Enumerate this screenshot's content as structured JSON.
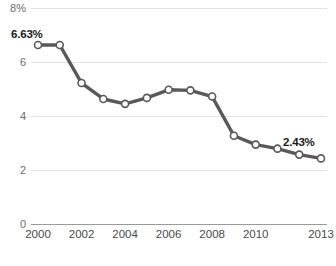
{
  "chart_data": {
    "type": "line",
    "title": "",
    "xlabel": "",
    "ylabel": "",
    "ylim": [
      0,
      8
    ],
    "grid": true,
    "legend": false,
    "x": [
      2000,
      2001,
      2002,
      2003,
      2004,
      2005,
      2006,
      2007,
      2008,
      2009,
      2010,
      2011,
      2012,
      2013
    ],
    "categories": [
      "2000",
      "2001",
      "2002",
      "2003",
      "2004",
      "2005",
      "2006",
      "2007",
      "2008",
      "2009",
      "2010",
      "2011",
      "2012",
      "2013"
    ],
    "values": [
      6.63,
      6.63,
      5.22,
      4.63,
      4.45,
      4.67,
      4.97,
      4.95,
      4.72,
      3.27,
      2.94,
      2.79,
      2.57,
      2.43
    ],
    "series": [
      {
        "name": "rate",
        "values": [
          6.63,
          6.63,
          5.22,
          4.63,
          4.45,
          4.67,
          4.97,
          4.95,
          4.72,
          3.27,
          2.94,
          2.79,
          2.57,
          2.43
        ]
      }
    ],
    "y_tick_labels": [
      "8%",
      "6",
      "4",
      "2",
      "0"
    ],
    "y_tick_values": [
      8,
      6,
      4,
      2,
      0
    ],
    "x_tick_labels": [
      "2000",
      "2002",
      "2004",
      "2006",
      "2008",
      "2010",
      "2013"
    ],
    "x_tick_values": [
      2000,
      2002,
      2004,
      2006,
      2008,
      2010,
      2013
    ],
    "annotations": [
      {
        "text": "6.63%",
        "x": 2000,
        "y": 6.63
      },
      {
        "text": "2.43%",
        "x": 2013,
        "y": 2.43
      }
    ],
    "colors": {
      "line": "#595959",
      "marker_fill": "#ffffff",
      "marker_stroke": "#595959",
      "gridline": "#e3e3e3",
      "axis": "#9a9a9a",
      "tick_text": "#6b6b6b",
      "annotation_text": "#1a1a1a",
      "background": "#ffffff"
    }
  }
}
